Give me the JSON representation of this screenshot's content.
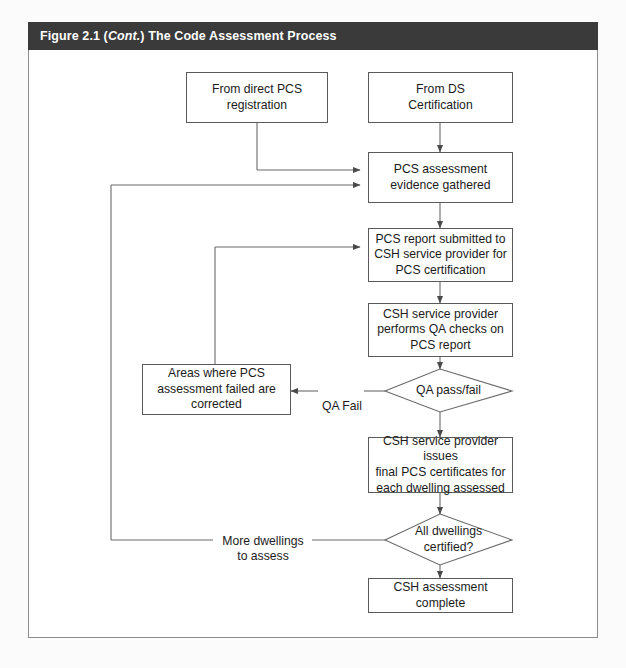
{
  "figure": {
    "caption_prefix": "Figure 2.1 (",
    "caption_italic": "Cont.",
    "caption_suffix": ") The Code Assessment Process",
    "caption_full": "Figure 2.1 (Cont.) The Code Assessment Process"
  },
  "diagram": {
    "type": "flowchart",
    "nodes": [
      {
        "id": "from-direct-pcs",
        "shape": "process",
        "label": "From direct PCS\nregistration"
      },
      {
        "id": "from-ds-cert",
        "shape": "process",
        "label": "From DS\nCertification"
      },
      {
        "id": "pcs-evidence",
        "shape": "process",
        "label": "PCS assessment\nevidence gathered"
      },
      {
        "id": "pcs-report-submitted",
        "shape": "process",
        "label": "PCS report submitted to\nCSH service provider for\nPCS certification"
      },
      {
        "id": "qa-checks",
        "shape": "process",
        "label": "CSH service provider\nperforms QA checks on\nPCS report"
      },
      {
        "id": "areas-corrected",
        "shape": "process",
        "label": "Areas where PCS\nassessment failed are\ncorrected"
      },
      {
        "id": "qa-pass-fail",
        "shape": "decision",
        "label": "QA pass/fail"
      },
      {
        "id": "issue-certificates",
        "shape": "process",
        "label": "CSH service provider issues\nfinal PCS certificates for\neach dwelling assessed"
      },
      {
        "id": "all-dwellings-certified",
        "shape": "decision",
        "label": "All dwellings\ncertified?"
      },
      {
        "id": "assessment-complete",
        "shape": "process",
        "label": "CSH assessment complete"
      }
    ],
    "edge_labels": [
      {
        "id": "qa-fail-label",
        "label": "QA Fail"
      },
      {
        "id": "more-dwellings-label",
        "label": "More dwellings\nto assess"
      }
    ]
  },
  "colors": {
    "caption_bar": "#3a3a3a",
    "caption_text": "#ffffff",
    "stroke": "#5a5a5a",
    "page": "#ffffff",
    "background": "#fbfbfb"
  }
}
